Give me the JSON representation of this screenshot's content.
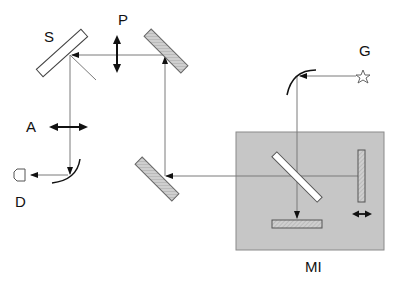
{
  "diagram": {
    "labels": {
      "S": "S",
      "P": "P",
      "G": "G",
      "A": "A",
      "D": "D",
      "MI": "MI"
    },
    "components": [
      {
        "id": "S",
        "name": "beam splitter S"
      },
      {
        "id": "P",
        "name": "polarizer P (vertical)"
      },
      {
        "id": "G",
        "name": "light source G (star)"
      },
      {
        "id": "A",
        "name": "analyzer A (horizontal)"
      },
      {
        "id": "D",
        "name": "detector D"
      },
      {
        "id": "MI",
        "name": "Michelson interferometer MI"
      }
    ],
    "colors": {
      "beam": "#7a7a7a",
      "mirror_fill": "#c8c8c8",
      "box_fill": "#c6c6c6",
      "box_border": "#8a8a8a",
      "arrow": "#111111"
    }
  }
}
